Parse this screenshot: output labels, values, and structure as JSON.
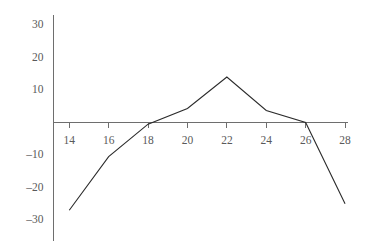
{
  "chart_data": {
    "type": "line",
    "title": "",
    "xlabel": "",
    "ylabel": "",
    "xlim": [
      13,
      28.6
    ],
    "ylim": [
      -31,
      31
    ],
    "grid": false,
    "legend": null,
    "x_ticks": [
      14,
      16,
      18,
      20,
      22,
      24,
      26,
      28
    ],
    "x_tick_labels": [
      "14",
      "16",
      "18",
      "20",
      "22",
      "24",
      "26",
      "28"
    ],
    "y_ticks": [
      30,
      20,
      10,
      -10,
      -20,
      -30
    ],
    "y_tick_labels": [
      "30",
      "20",
      "10",
      "–10",
      "–20",
      "–30"
    ],
    "series": [
      {
        "name": "series-1",
        "color": "#2b2b2b",
        "x": [
          14,
          16,
          18,
          20,
          22,
          24,
          26,
          28
        ],
        "values": [
          -27,
          -10.5,
          -0.5,
          4.3,
          14,
          3.7,
          0,
          -25
        ]
      }
    ],
    "axis_color": "#6e6e6e",
    "label_color": "#5a5a5a",
    "background": "#ffffff"
  }
}
